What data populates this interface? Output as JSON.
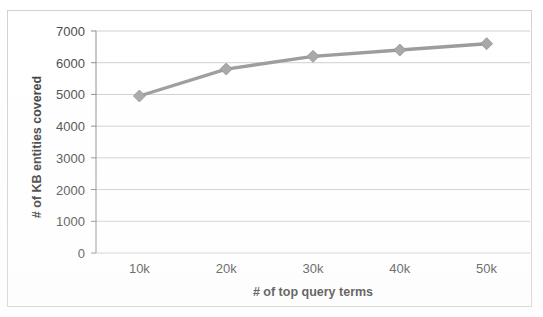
{
  "chart_data": {
    "type": "line",
    "title": "",
    "subtitle": "",
    "xlabel": "# of top query terms",
    "ylabel": "# of KB entities covered",
    "categories": [
      "10k",
      "20k",
      "30k",
      "40k",
      "50k"
    ],
    "x_values": [
      10000,
      20000,
      30000,
      40000,
      50000
    ],
    "series": [
      {
        "name": "# of KB entities covered",
        "values": [
          4950,
          5800,
          6200,
          6400,
          6600
        ],
        "color": "#999999",
        "marker": "diamond"
      }
    ],
    "ylim": [
      0,
      7000
    ],
    "ytick_labels": [
      "0",
      "1000",
      "2000",
      "3000",
      "4000",
      "5000",
      "6000",
      "7000"
    ],
    "ytick_values": [
      0,
      1000,
      2000,
      3000,
      4000,
      5000,
      6000,
      7000
    ],
    "xtick_labels": [
      "10k",
      "20k",
      "30k",
      "40k",
      "50k"
    ],
    "grid": "horizontal",
    "legend": "none",
    "legend_position": "none",
    "axis_color": "#808080",
    "grid_color": "#c8c8c8",
    "plot_background": "#ffffff",
    "frame_color": "#d2d2d2"
  }
}
